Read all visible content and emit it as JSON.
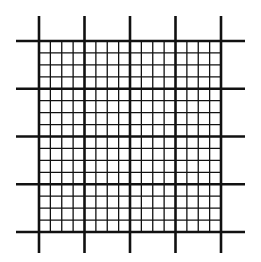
{
  "figure": {
    "type": "counting-chamber-grid",
    "major_divisions": 4,
    "minor_per_major": 4,
    "major_x": [
      39,
      84.5,
      130,
      175.5,
      221
    ],
    "major_y": [
      41,
      88.75,
      136.5,
      184.25,
      232
    ],
    "extension": {
      "left": 16,
      "right": 245,
      "top": 16,
      "bottom": 253
    },
    "colors": {
      "line": "#111111",
      "background": "#ffffff"
    },
    "stroke": {
      "major": 2.6,
      "minor": 1.3
    }
  }
}
